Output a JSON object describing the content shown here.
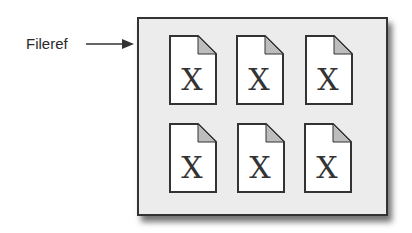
{
  "label": "Fileref",
  "documents": [
    {
      "row": 0,
      "col": 0,
      "glyph": "X"
    },
    {
      "row": 0,
      "col": 1,
      "glyph": "X"
    },
    {
      "row": 0,
      "col": 2,
      "glyph": "X"
    },
    {
      "row": 1,
      "col": 0,
      "glyph": "X"
    },
    {
      "row": 1,
      "col": 1,
      "glyph": "X"
    },
    {
      "row": 1,
      "col": 2,
      "glyph": "X"
    }
  ],
  "colors": {
    "box_fill": "#ececec",
    "page": "#ffffff",
    "fold": "#bdbdbd",
    "stroke": "#333333"
  }
}
